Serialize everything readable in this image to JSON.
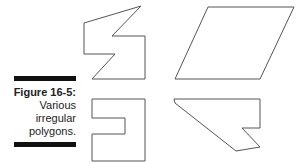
{
  "figure": {
    "label": "Figure 16-5:",
    "caption_lines": [
      "Various",
      "irregular",
      "polygons."
    ]
  },
  "polygons": [
    {
      "name": "zigzag-polygon",
      "points": "84,23 141,6 112,36 145,36 145,79 92,79 115,54 84,54"
    },
    {
      "name": "parallelogram",
      "points": "208,7 294,7 260,79 175,79"
    },
    {
      "name": "notched-rectangle",
      "points": "92,99 145,99 145,161 92,161 92,134 125,134 125,118 92,118"
    },
    {
      "name": "arrow-polygon",
      "points": "174,99 260,99 260,128 242,128 260,147 236,151 175,103"
    }
  ],
  "colors": {
    "stroke": "#555555",
    "bar": "#111111"
  }
}
